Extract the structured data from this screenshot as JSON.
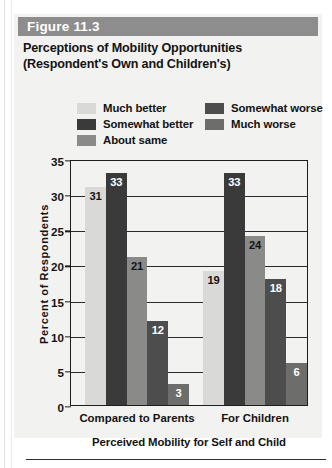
{
  "figure": {
    "band_label": "Figure 11.3",
    "title_line1": "Perceptions of Mobility Opportunities",
    "title_line2": "(Respondent's Own and Children's)",
    "band_color": "#8d8d8d"
  },
  "legend": {
    "left_column": [
      {
        "label": "Much better",
        "color": "#d9d9d7"
      },
      {
        "label": "Somewhat better",
        "color": "#3a3a3a"
      },
      {
        "label": "About same",
        "color": "#8a8a88"
      }
    ],
    "right_column": [
      {
        "label": "Somewhat worse",
        "color": "#4d4d4d"
      },
      {
        "label": "Much worse",
        "color": "#6d6d6b"
      }
    ]
  },
  "chart_data": {
    "type": "bar",
    "title": "Perceptions of Mobility Opportunities (Respondent's Own and Children's)",
    "xlabel": "Perceived Mobility for Self and Child",
    "ylabel": "Percent of Respondents",
    "categories": [
      "Compared to Parents",
      "For Children"
    ],
    "ylim": [
      0,
      35
    ],
    "yticks": [
      0,
      5,
      10,
      15,
      20,
      25,
      30,
      35
    ],
    "grid": true,
    "legend_position": "top",
    "series": [
      {
        "name": "Much better",
        "color": "#d9d9d7",
        "label_color": "#131313",
        "values": [
          31,
          19
        ]
      },
      {
        "name": "Somewhat better",
        "color": "#3a3a3a",
        "label_color": "#ffffff",
        "values": [
          33,
          33
        ]
      },
      {
        "name": "About same",
        "color": "#8a8a88",
        "label_color": "#131313",
        "values": [
          21,
          24
        ]
      },
      {
        "name": "Somewhat worse",
        "color": "#4d4d4d",
        "label_color": "#ffffff",
        "values": [
          12,
          18
        ]
      },
      {
        "name": "Much worse",
        "color": "#6d6d6b",
        "label_color": "#ffffff",
        "values": [
          3,
          6
        ]
      }
    ]
  }
}
